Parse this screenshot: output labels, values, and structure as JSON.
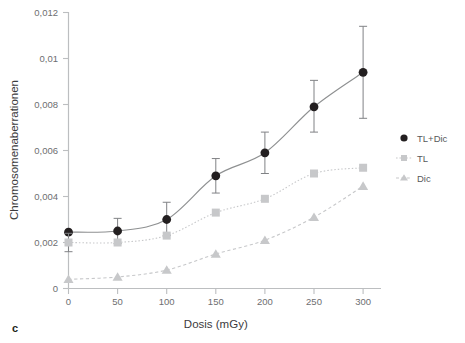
{
  "figure": {
    "panel_label": "c"
  },
  "chart_data": {
    "type": "line",
    "title": "",
    "xlabel": "Dosis (mGy)",
    "ylabel": "Chromosomenaberrationen",
    "x": [
      0,
      50,
      100,
      150,
      200,
      250,
      300
    ],
    "xtick_labels": [
      "0",
      "50",
      "100",
      "150",
      "200",
      "250",
      "300"
    ],
    "ytick_labels": [
      "0",
      "0,002",
      "0,004",
      "0,006",
      "0,008",
      "0,01",
      "0,012"
    ],
    "ytick_values": [
      0,
      0.002,
      0.004,
      0.006,
      0.008,
      0.01,
      0.012
    ],
    "xlim": [
      0,
      300
    ],
    "ylim": [
      0,
      0.012
    ],
    "grid": false,
    "legend_position": "right",
    "series": [
      {
        "name": "TL+Dic",
        "marker": "circle",
        "color": "#231f20",
        "line_style": "solid",
        "values": [
          0.00245,
          0.0025,
          0.003,
          0.0049,
          0.0059,
          0.0079,
          0.0094
        ],
        "error_low": [
          0.00245,
          0.00195,
          0.0023,
          0.00415,
          0.005,
          0.0068,
          0.0074
        ],
        "error_high": [
          0.00245,
          0.00305,
          0.00375,
          0.00565,
          0.0068,
          0.00905,
          0.0114
        ]
      },
      {
        "name": "TL",
        "marker": "square",
        "color": "#c7c8ca",
        "line_style": "dotted",
        "values": [
          0.002,
          0.002,
          0.0023,
          0.0033,
          0.0039,
          0.005,
          0.00525
        ],
        "error_low": [
          0.0016,
          0.002,
          0.0023,
          0.0033,
          0.0039,
          0.005,
          0.00525
        ],
        "error_high": [
          0.0024,
          0.002,
          0.0023,
          0.0033,
          0.0039,
          0.005,
          0.00525
        ]
      },
      {
        "name": "Dic",
        "marker": "triangle",
        "color": "#c7c8ca",
        "line_style": "dashed",
        "values": [
          0.0004,
          0.0005,
          0.0008,
          0.0015,
          0.0021,
          0.0031,
          0.00445
        ],
        "error_low": [
          0.0004,
          0.0005,
          0.0008,
          0.0015,
          0.0021,
          0.0031,
          0.00445
        ],
        "error_high": [
          0.0004,
          0.0005,
          0.0008,
          0.0015,
          0.0021,
          0.0031,
          0.00445
        ]
      }
    ],
    "trend_line": {
      "name": "TL+Dic fit",
      "color": "#8e9091",
      "description": "smooth quadratic fit through TL+Dic points"
    }
  },
  "legend": {
    "entries": [
      {
        "label": "TL+Dic",
        "marker": "circle",
        "color": "#231f20"
      },
      {
        "label": "TL",
        "marker": "square",
        "color": "#c7c8ca"
      },
      {
        "label": "Dic",
        "marker": "triangle",
        "color": "#c7c8ca"
      }
    ]
  },
  "colors": {
    "axis": "#bcbec0",
    "tick_text": "#6d6e70",
    "title_text": "#3b3b3d",
    "dark_series": "#231f20",
    "light_series": "#c7c8ca",
    "fit_line": "#8e9091",
    "error_bar": "#808285",
    "background": "#ffffff"
  }
}
